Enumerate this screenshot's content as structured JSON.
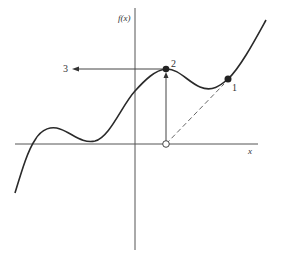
{
  "diagram": {
    "y_axis_label": "f(x)",
    "x_axis_label": "x",
    "points": [
      {
        "label": "1",
        "description": "starting point on curve (filled)"
      },
      {
        "label": "2",
        "description": "local maximum on curve (filled)"
      },
      {
        "label": "3",
        "description": "arrow target on y-axis side"
      }
    ],
    "colors": {
      "curve": "#2a2a2a",
      "axes": "#555555",
      "background": "#ffffff"
    }
  }
}
